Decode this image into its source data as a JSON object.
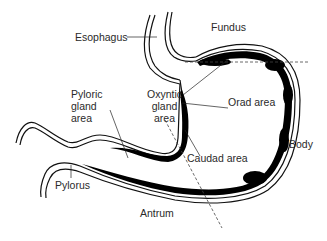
{
  "diagram": {
    "labels": {
      "esophagus": "Esophagus",
      "fundus": "Fundus",
      "pyloric_gland_area": "Pyloric\ngland\narea",
      "oxyntic_gland_area": "Oxyntic\ngland\narea",
      "orad_area": "Orad area",
      "body": "Body",
      "caudad_area": "Caudad area",
      "pylorus": "Pylorus",
      "antrum": "Antrum"
    },
    "colors": {
      "line": "#111111",
      "text": "#2a2a2a",
      "muscle": "#000000",
      "dashed": "#444444"
    }
  }
}
